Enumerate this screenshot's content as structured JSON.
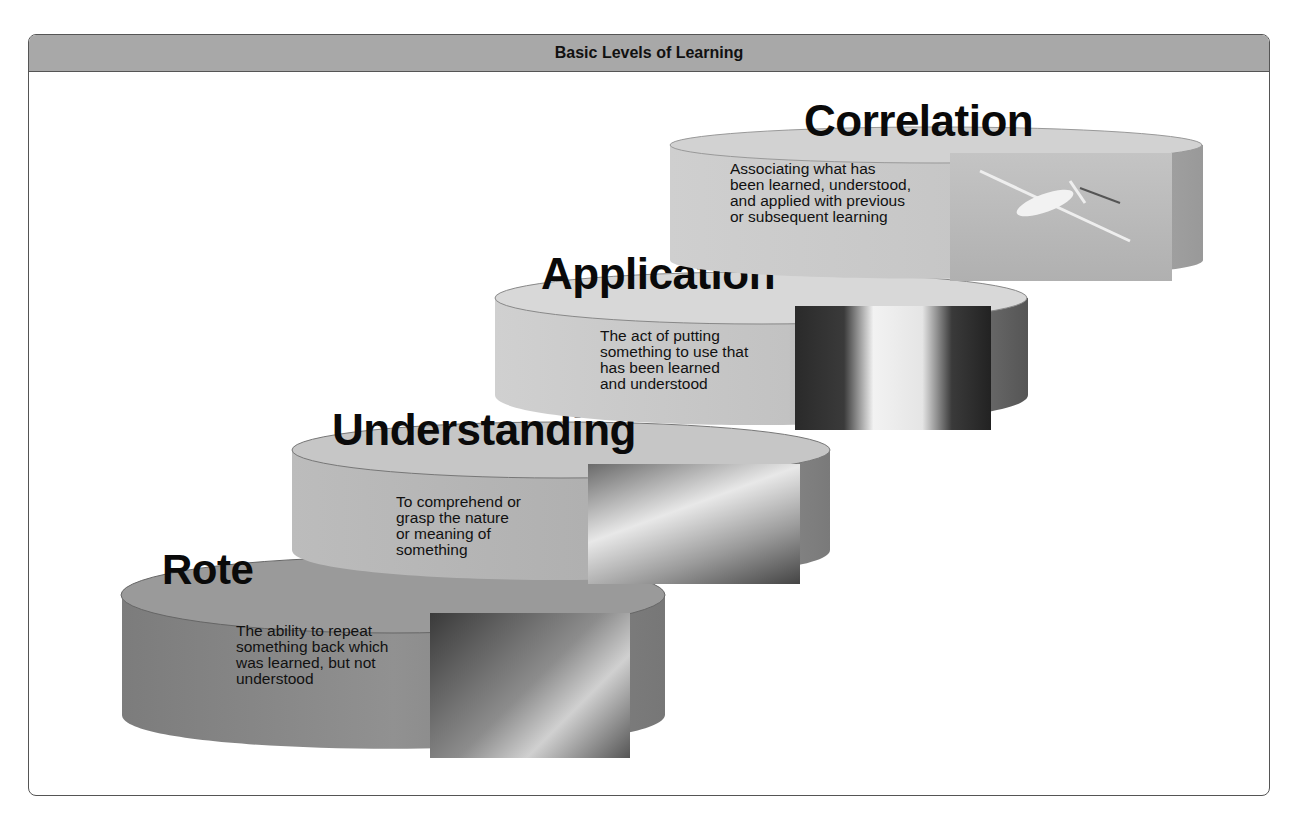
{
  "header": {
    "title": "Basic Levels of Learning"
  },
  "levels": [
    {
      "name": "Rote",
      "description": [
        "The ability to repeat",
        "something back which",
        "was learned, but not",
        "understood"
      ],
      "photo": "elderly-man-reading-photo",
      "side_color": "#8a8a8a",
      "top_color": "#9a9a9a"
    },
    {
      "name": "Understanding",
      "description": [
        "To comprehend or",
        "grasp the nature",
        "or meaning of",
        "something"
      ],
      "photo": "instructor-student-by-aircraft-photo",
      "side_color": "#b5b5b5",
      "top_color": "#c4c4c4"
    },
    {
      "name": "Application",
      "description": [
        "The act of putting",
        "something to use that",
        "has been learned",
        "and understood"
      ],
      "photo": "pilots-in-cockpit-photo",
      "side_color": "#c8c8c8",
      "top_color": "#d6d6d6"
    },
    {
      "name": "Correlation",
      "description": [
        "Associating what has",
        "been learned, understood,",
        "and applied with previous",
        "or subsequent learning"
      ],
      "photo": "jet-in-flight-photo",
      "side_color": "#c0c0c0",
      "top_color": "#cfcfcf"
    }
  ]
}
